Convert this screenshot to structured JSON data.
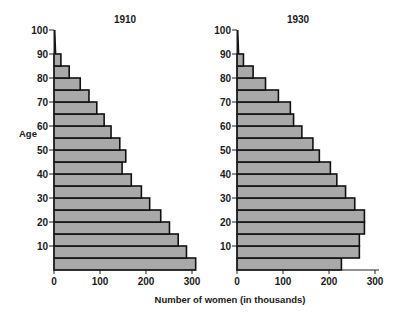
{
  "chart_data": [
    {
      "type": "bar",
      "orientation": "horizontal",
      "title": "1910",
      "xlabel": "Number of women (in thousands)",
      "ylabel": "Age",
      "xlim": [
        0,
        300
      ],
      "ylim": [
        0,
        100
      ],
      "x_ticks": [
        0,
        100,
        200,
        300
      ],
      "y_ticks": [
        10,
        20,
        30,
        40,
        50,
        60,
        70,
        80,
        90,
        100
      ],
      "categories": [
        "0-5",
        "5-10",
        "10-15",
        "15-20",
        "20-25",
        "25-30",
        "30-35",
        "35-40",
        "40-45",
        "45-50",
        "50-55",
        "55-60",
        "60-65",
        "65-70",
        "70-75",
        "75-80",
        "80-85",
        "85-90",
        "90-100"
      ],
      "values": [
        308,
        288,
        270,
        251,
        232,
        208,
        190,
        168,
        148,
        156,
        143,
        124,
        109,
        93,
        76,
        57,
        33,
        15,
        3
      ],
      "grid": false
    },
    {
      "type": "bar",
      "orientation": "horizontal",
      "title": "1930",
      "xlabel": "Number of women (in thousands)",
      "ylabel": "Age",
      "xlim": [
        0,
        300
      ],
      "ylim": [
        0,
        100
      ],
      "x_ticks": [
        0,
        100,
        200,
        300
      ],
      "y_ticks": [
        10,
        20,
        30,
        40,
        50,
        60,
        70,
        80,
        90,
        100
      ],
      "categories": [
        "0-5",
        "5-10",
        "10-15",
        "15-20",
        "20-25",
        "25-30",
        "30-35",
        "35-40",
        "40-45",
        "45-50",
        "50-55",
        "55-60",
        "60-65",
        "65-70",
        "70-75",
        "75-80",
        "80-85",
        "85-90",
        "90-100"
      ],
      "values": [
        227,
        266,
        266,
        277,
        277,
        256,
        236,
        217,
        203,
        179,
        165,
        141,
        123,
        116,
        90,
        62,
        35,
        14,
        3
      ],
      "grid": false
    }
  ],
  "labels": {
    "title_left": "1910",
    "title_right": "1930",
    "ylabel": "Age",
    "xlabel": "Number of women (in thousands)",
    "x_ticks": [
      "0",
      "100",
      "200",
      "300"
    ],
    "y_ticks": [
      "10",
      "20",
      "30",
      "40",
      "50",
      "60",
      "70",
      "80",
      "90",
      "100"
    ]
  }
}
